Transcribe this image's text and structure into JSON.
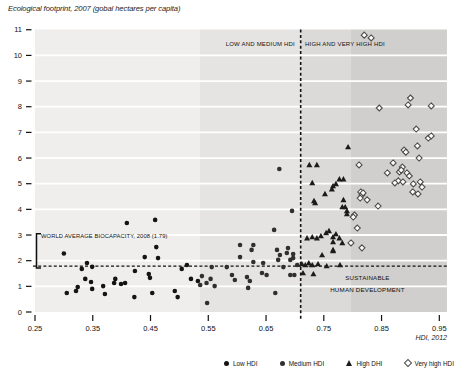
{
  "title": "Ecological footprint, 2007 (gobal hectares per capita)",
  "xlabel": "HDI, 2012",
  "region_labels": {
    "left": "LOW AND MEDIUM HDI",
    "right": "HIGH AND VERY HIGH HDI"
  },
  "biocapacity_label": "WORLD AVERAGE BIOCAPACITY, 2008 (1.79)",
  "sustainable_label": "SUSTAINABLE HUMAN DEVELOPMENT",
  "sustainable_lines": {
    "line1": "SUSTAINABLE",
    "line2": "HUMAN DEVELOPMENT"
  },
  "legend": [
    {
      "label": "Low HDI",
      "marker": "circle",
      "color": "#141414"
    },
    {
      "label": "Medium HDI",
      "marker": "circle",
      "color": "#2f2f2f"
    },
    {
      "label": "High DHI",
      "marker": "triangle",
      "color": "#1b1b1b"
    },
    {
      "label": "Very high HDI",
      "marker": "diamond-open",
      "color": "#4d4d4d"
    }
  ],
  "chart_data": {
    "type": "scatter",
    "title": "Ecological footprint, 2007 (gobal hectares per capita)",
    "xlabel": "HDI, 2012",
    "ylabel": "Ecological footprint (global hectares per capita)",
    "xlim": [
      0.25,
      0.95
    ],
    "ylim": [
      0,
      11
    ],
    "x_ticks": [
      "0.25",
      "0.35",
      "0.45",
      "0.55",
      "0.65",
      "0.75",
      "0.85",
      "0.95"
    ],
    "y_ticks": [
      0,
      1,
      2,
      3,
      4,
      5,
      6,
      7,
      8,
      9,
      10,
      11
    ],
    "grid": "horizontal-white",
    "legend_position": "bottom",
    "bands": [
      {
        "name": "low-hdi-band",
        "from": 0.25,
        "to": 0.535,
        "color": "#efeeec"
      },
      {
        "name": "medium-hdi-band",
        "from": 0.535,
        "to": 0.711,
        "color": "#e5e4e2"
      },
      {
        "name": "high-hdi-band",
        "from": 0.711,
        "to": 0.796,
        "color": "#dbdad8"
      },
      {
        "name": "very-high-hdi-band",
        "from": 0.796,
        "to": null,
        "color": "#d0cfcd"
      }
    ],
    "reference_lines": {
      "vertical": {
        "x": 0.71,
        "style": "dashed",
        "label_left": "LOW AND MEDIUM HDI",
        "label_right": "HIGH AND VERY HIGH HDI"
      },
      "horizontal": {
        "y": 1.79,
        "style": "dashed",
        "label": "WORLD AVERAGE BIOCAPACITY, 2008 (1.79)"
      }
    },
    "annotations": [
      "SUSTAINABLE HUMAN DEVELOPMENT"
    ],
    "series": [
      {
        "name": "Low HDI",
        "marker": "circle",
        "color": "#141414",
        "points": [
          [
            0.3,
            2.28
          ],
          [
            0.34,
            1.91
          ],
          [
            0.331,
            1.68
          ],
          [
            0.349,
            1.76
          ],
          [
            0.337,
            1.29
          ],
          [
            0.347,
            1.17
          ],
          [
            0.305,
            0.74
          ],
          [
            0.321,
            0.82
          ],
          [
            0.324,
            0.97
          ],
          [
            0.368,
            1.01
          ],
          [
            0.349,
            0.9
          ],
          [
            0.371,
            0.7
          ],
          [
            0.389,
            1.29
          ],
          [
            0.387,
            1.13
          ],
          [
            0.399,
            1.09
          ],
          [
            0.406,
            1.13
          ],
          [
            0.423,
            1.6
          ],
          [
            0.44,
            2.14
          ],
          [
            0.449,
            1.33
          ],
          [
            0.447,
            1.48
          ],
          [
            0.453,
            0.74
          ],
          [
            0.422,
            0.58
          ],
          [
            0.492,
            0.82
          ],
          [
            0.497,
            0.58
          ],
          [
            0.504,
            1.68
          ],
          [
            0.513,
            1.83
          ],
          [
            0.52,
            1.29
          ],
          [
            0.532,
            1.21
          ],
          [
            0.409,
            3.47
          ],
          [
            0.458,
            3.59
          ],
          [
            0.46,
            2.53
          ],
          [
            0.463,
            2.1
          ]
        ]
      },
      {
        "name": "Medium HDI",
        "marker": "circle",
        "color": "#2f2f2f",
        "points": [
          [
            0.536,
            1.05
          ],
          [
            0.539,
            1.4
          ],
          [
            0.547,
            1.13
          ],
          [
            0.554,
            1.29
          ],
          [
            0.561,
            1.01
          ],
          [
            0.548,
            0.35
          ],
          [
            0.556,
            1.75
          ],
          [
            0.582,
            1.75
          ],
          [
            0.605,
            2.14
          ],
          [
            0.605,
            2.61
          ],
          [
            0.625,
            2.42
          ],
          [
            0.628,
            1.95
          ],
          [
            0.628,
            2.61
          ],
          [
            0.596,
            1.25
          ],
          [
            0.591,
            1.44
          ],
          [
            0.617,
            1.36
          ],
          [
            0.622,
            1.21
          ],
          [
            0.619,
            0.94
          ],
          [
            0.643,
            1.52
          ],
          [
            0.651,
            1.44
          ],
          [
            0.645,
            1.91
          ],
          [
            0.669,
            2.42
          ],
          [
            0.671,
            2.03
          ],
          [
            0.686,
            2.3
          ],
          [
            0.68,
            1.75
          ],
          [
            0.692,
            1.44
          ],
          [
            0.666,
            0.74
          ],
          [
            0.704,
            1.83
          ],
          [
            0.692,
            2.03
          ],
          [
            0.664,
            3.2
          ],
          [
            0.673,
            5.57
          ],
          [
            0.695,
            3.94
          ],
          [
            0.697,
            2.26
          ],
          [
            0.697,
            2.1
          ],
          [
            0.688,
            2.49
          ],
          [
            0.674,
            2.22
          ],
          [
            0.699,
            1.44
          ]
        ]
      },
      {
        "name": "High DHI",
        "marker": "triangle",
        "color": "#1b1b1b",
        "points": [
          [
            0.725,
            5.73
          ],
          [
            0.738,
            5.73
          ],
          [
            0.792,
            6.43
          ],
          [
            0.73,
            5.03
          ],
          [
            0.777,
            5.18
          ],
          [
            0.784,
            5.18
          ],
          [
            0.766,
            4.91
          ],
          [
            0.771,
            4.99
          ],
          [
            0.764,
            4.79
          ],
          [
            0.752,
            4.6
          ],
          [
            0.735,
            4.25
          ],
          [
            0.784,
            4.37
          ],
          [
            0.787,
            4.09
          ],
          [
            0.79,
            3.94
          ],
          [
            0.782,
            4.09
          ],
          [
            0.79,
            3.82
          ],
          [
            0.733,
            4.33
          ],
          [
            0.754,
            3.08
          ],
          [
            0.759,
            3.16
          ],
          [
            0.771,
            3.04
          ],
          [
            0.73,
            2.92
          ],
          [
            0.721,
            2.88
          ],
          [
            0.738,
            2.88
          ],
          [
            0.745,
            2.96
          ],
          [
            0.766,
            2.92
          ],
          [
            0.777,
            2.88
          ],
          [
            0.782,
            2.69
          ],
          [
            0.766,
            2.73
          ],
          [
            0.766,
            2.42
          ],
          [
            0.766,
            2.38
          ],
          [
            0.747,
            2.22
          ],
          [
            0.714,
            1.52
          ],
          [
            0.732,
            1.48
          ],
          [
            0.712,
            1.87
          ],
          [
            0.718,
            1.83
          ],
          [
            0.724,
            1.91
          ],
          [
            0.73,
            1.83
          ],
          [
            0.74,
            1.87
          ],
          [
            0.755,
            1.79
          ],
          [
            0.778,
            1.83
          ]
        ]
      },
      {
        "name": "Very high HDI",
        "marker": "diamond-open",
        "color": "#4d4d4d",
        "points": [
          [
            0.82,
            10.79
          ],
          [
            0.832,
            10.68
          ],
          [
            0.9,
            8.34
          ],
          [
            0.896,
            8.07
          ],
          [
            0.846,
            7.95
          ],
          [
            0.936,
            8.03
          ],
          [
            0.931,
            6.78
          ],
          [
            0.91,
            7.13
          ],
          [
            0.936,
            6.86
          ],
          [
            0.912,
            6.47
          ],
          [
            0.889,
            6.31
          ],
          [
            0.915,
            6.0
          ],
          [
            0.886,
            5.65
          ],
          [
            0.881,
            5.46
          ],
          [
            0.894,
            5.42
          ],
          [
            0.898,
            5.3
          ],
          [
            0.879,
            5.11
          ],
          [
            0.887,
            5.07
          ],
          [
            0.905,
            4.99
          ],
          [
            0.917,
            5.07
          ],
          [
            0.92,
            4.87
          ],
          [
            0.913,
            4.6
          ],
          [
            0.892,
            6.23
          ],
          [
            0.87,
            5.81
          ],
          [
            0.86,
            5.42
          ],
          [
            0.884,
            5.53
          ],
          [
            0.873,
            5.03
          ],
          [
            0.811,
            5.73
          ],
          [
            0.814,
            4.68
          ],
          [
            0.816,
            4.56
          ],
          [
            0.813,
            4.44
          ],
          [
            0.844,
            4.13
          ],
          [
            0.825,
            4.37
          ],
          [
            0.818,
            4.64
          ],
          [
            0.803,
            3.78
          ],
          [
            0.801,
            3.7
          ],
          [
            0.808,
            3.27
          ],
          [
            0.797,
            2.69
          ],
          [
            0.816,
            2.5
          ],
          [
            0.904,
            4.68
          ]
        ]
      }
    ]
  }
}
